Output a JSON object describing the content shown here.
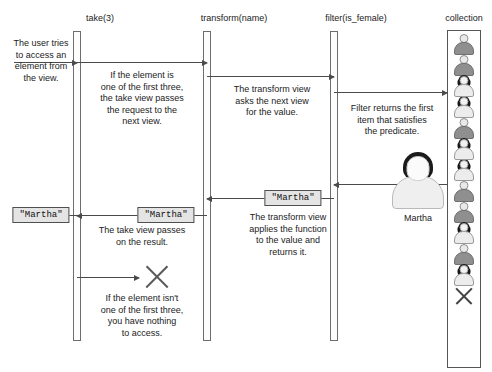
{
  "diagram": {
    "title_glyph_row": "",
    "lifelines": [
      {
        "name": "take",
        "label": "take(3)",
        "x": 77,
        "bar_top": 31,
        "bar_height": 310
      },
      {
        "name": "transform",
        "label": "transform(name)",
        "x": 207,
        "bar_top": 31,
        "bar_height": 310
      },
      {
        "name": "filter",
        "label": "filter(is_female)",
        "x": 334,
        "bar_top": 31,
        "bar_height": 310
      }
    ],
    "collection": {
      "label": "collection",
      "box": {
        "x": 447,
        "y": 30,
        "width": 34,
        "height": 338
      },
      "items": [
        "male",
        "male",
        "female",
        "female",
        "male",
        "female",
        "female",
        "male",
        "male",
        "female",
        "male",
        "female"
      ],
      "end_marker": "x-icon"
    },
    "actor": {
      "label": "Martha",
      "figure_name": "martha-person-icon"
    },
    "messages": [
      {
        "name": "user-request",
        "text": "The user tries\nto access an\nelement from\nthe view."
      },
      {
        "name": "take-to-transform",
        "text": "If the element is\none of the first three,\nthe take view passes\nthe request to the\nnext view."
      },
      {
        "name": "transform-to-filter",
        "text": "The transform view\nasks the next view\nfor the value."
      },
      {
        "name": "filter-to-collection",
        "text": "Filter returns the first\nitem that satisfies\nthe predicate."
      },
      {
        "name": "transform-return",
        "text": "The transform view\napplies the function\nto the value and\nreturns it."
      },
      {
        "name": "take-return",
        "text": "The take view passes\non the result."
      },
      {
        "name": "take-failure",
        "text": "If the element isn't\none of the first three,\nyou have nothing\nto access."
      }
    ],
    "values": [
      {
        "name": "value-returned-to-user",
        "text": "\"Martha\""
      },
      {
        "name": "value-at-take",
        "text": "\"Martha\""
      },
      {
        "name": "value-at-filter",
        "text": "\"Martha\""
      }
    ]
  }
}
